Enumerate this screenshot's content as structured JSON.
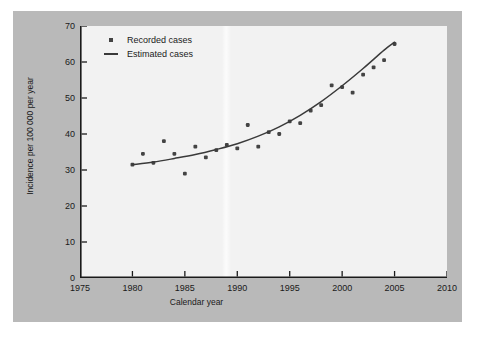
{
  "chart_data": {
    "type": "scatter",
    "title": "",
    "xlabel": "Calendar year",
    "ylabel": "Incidence per 100 000 per year",
    "xlim": [
      1975,
      2010
    ],
    "ylim": [
      0,
      70
    ],
    "xticks": [
      1975,
      1980,
      1985,
      1990,
      1995,
      2000,
      2005,
      2010
    ],
    "yticks": [
      0,
      10,
      20,
      30,
      40,
      50,
      60,
      70
    ],
    "grid": false,
    "legend_position": "top-left",
    "series": [
      {
        "name": "Recorded cases",
        "type": "scatter",
        "marker": "square-dot",
        "color": "#444444",
        "x": [
          1980,
          1981,
          1982,
          1983,
          1984,
          1985,
          1986,
          1987,
          1988,
          1989,
          1990,
          1991,
          1992,
          1993,
          1994,
          1995,
          1996,
          1997,
          1998,
          1999,
          2000,
          2001,
          2002,
          2003,
          2004,
          2005
        ],
        "y": [
          31.5,
          34.5,
          32.0,
          38.0,
          34.5,
          29.0,
          36.5,
          33.5,
          35.5,
          37.0,
          36.0,
          42.5,
          36.5,
          40.5,
          40.0,
          43.5,
          43.0,
          46.5,
          48.0,
          53.5,
          53.0,
          51.5,
          56.5,
          58.5,
          60.5,
          65.0
        ]
      },
      {
        "name": "Estimated cases",
        "type": "line",
        "color": "#3a3a3a",
        "x": [
          1980,
          1982,
          1984,
          1986,
          1988,
          1990,
          1992,
          1994,
          1996,
          1998,
          2000,
          2002,
          2004,
          2005
        ],
        "y": [
          31.5,
          32.2,
          33.2,
          34.3,
          35.7,
          37.3,
          39.4,
          42.0,
          45.2,
          49.0,
          53.4,
          58.2,
          63.3,
          65.5
        ]
      }
    ]
  },
  "legend": {
    "items": [
      {
        "label": "Recorded cases",
        "key": "marker-dot"
      },
      {
        "label": "Estimated cases",
        "key": "marker-line"
      }
    ]
  },
  "axes": {
    "x_tick_labels": [
      "1975",
      "1980",
      "1985",
      "1990",
      "1995",
      "2000",
      "2005",
      "2010"
    ],
    "y_tick_labels": [
      "0",
      "10",
      "20",
      "30",
      "40",
      "50",
      "60",
      "70"
    ],
    "x_axis_title": "Calendar year",
    "y_axis_title": "Incidence per 100 000 per year"
  },
  "colors": {
    "figure_background": "#b9b9b9",
    "plot_background": "#f2f2f2",
    "axis": "#1a1a1a",
    "marker": "#444444",
    "line": "#3a3a3a"
  }
}
